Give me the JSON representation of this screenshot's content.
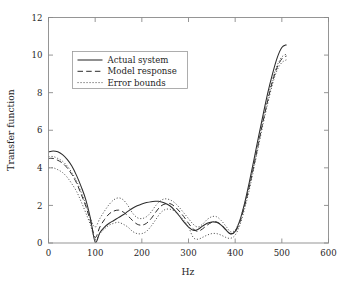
{
  "chart_data": {
    "type": "line",
    "title": "",
    "xlabel": "Hz",
    "ylabel": "Transfer function",
    "xlim": [
      0,
      600
    ],
    "ylim": [
      0,
      12
    ],
    "xticks": [
      0,
      100,
      200,
      300,
      400,
      500,
      600
    ],
    "yticks": [
      0,
      2,
      4,
      6,
      8,
      10,
      12
    ],
    "xtick_labels": [
      "0",
      "100",
      "200",
      "300",
      "400",
      "500",
      "600"
    ],
    "ytick_labels": [
      "0",
      "2",
      "4",
      "6",
      "8",
      "10",
      "12"
    ],
    "grid": false,
    "legend_position": "upper left inside",
    "line_color": "#2b2b2b",
    "axis_color": "#8a8a8a",
    "legend": [
      {
        "label": "Actual system",
        "style": "solid"
      },
      {
        "label": "Model response",
        "style": "dashed"
      },
      {
        "label": "Error bounds",
        "style": "dotted"
      }
    ],
    "series": [
      {
        "name": "Actual system",
        "style": "solid",
        "x": [
          0,
          10,
          20,
          30,
          40,
          50,
          60,
          70,
          80,
          90,
          100,
          110,
          120,
          130,
          140,
          150,
          160,
          170,
          180,
          190,
          200,
          210,
          220,
          230,
          235,
          240,
          250,
          260,
          270,
          280,
          290,
          300,
          310,
          320,
          330,
          340,
          350,
          360,
          370,
          380,
          390,
          400,
          410,
          420,
          430,
          440,
          450,
          460,
          470,
          480,
          490,
          500,
          510
        ],
        "y": [
          4.85,
          4.9,
          4.85,
          4.7,
          4.45,
          4.1,
          3.6,
          3.0,
          2.3,
          1.3,
          0.05,
          0.55,
          0.85,
          1.05,
          1.2,
          1.35,
          1.5,
          1.68,
          1.85,
          1.98,
          2.08,
          2.15,
          2.2,
          2.22,
          2.22,
          2.2,
          2.12,
          1.98,
          1.75,
          1.45,
          1.12,
          0.85,
          0.68,
          0.72,
          0.9,
          1.05,
          1.12,
          1.1,
          0.95,
          0.7,
          0.48,
          0.62,
          1.2,
          2.1,
          3.2,
          4.4,
          5.65,
          6.85,
          8.0,
          9.0,
          9.85,
          10.4,
          10.55
        ]
      },
      {
        "name": "Model response",
        "style": "dashed",
        "x": [
          0,
          10,
          20,
          30,
          40,
          50,
          60,
          70,
          80,
          90,
          100,
          110,
          120,
          130,
          140,
          150,
          160,
          170,
          180,
          190,
          200,
          210,
          220,
          230,
          240,
          250,
          260,
          270,
          280,
          290,
          300,
          310,
          320,
          330,
          340,
          350,
          360,
          370,
          380,
          390,
          400,
          410,
          420,
          430,
          440,
          450,
          460,
          470,
          480,
          490,
          500,
          510
        ],
        "y": [
          4.5,
          4.5,
          4.4,
          4.25,
          4.0,
          3.65,
          3.2,
          2.6,
          1.95,
          1.15,
          0.3,
          0.85,
          1.25,
          1.55,
          1.7,
          1.75,
          1.65,
          1.45,
          1.2,
          1.0,
          0.95,
          1.05,
          1.3,
          1.65,
          1.95,
          2.08,
          2.1,
          1.95,
          1.7,
          1.4,
          1.05,
          0.75,
          0.62,
          0.75,
          0.95,
          1.1,
          1.12,
          0.98,
          0.72,
          0.5,
          0.6,
          1.1,
          1.95,
          2.95,
          4.1,
          5.3,
          6.5,
          7.6,
          8.6,
          9.35,
          9.8,
          9.95
        ]
      },
      {
        "name": "Error bounds upper",
        "style": "dotted",
        "x": [
          0,
          10,
          20,
          30,
          40,
          50,
          60,
          70,
          80,
          90,
          100,
          110,
          120,
          130,
          140,
          150,
          160,
          170,
          180,
          190,
          200,
          210,
          220,
          230,
          240,
          250,
          260,
          270,
          280,
          290,
          300,
          310,
          320,
          330,
          340,
          350,
          360,
          370,
          380,
          390,
          400,
          410,
          420,
          430,
          440,
          450,
          460,
          470,
          480,
          490,
          500,
          510
        ],
        "y": [
          4.6,
          4.6,
          4.5,
          4.35,
          4.1,
          3.75,
          3.3,
          2.7,
          2.05,
          1.3,
          0.85,
          1.3,
          1.7,
          2.05,
          2.3,
          2.4,
          2.3,
          2.0,
          1.6,
          1.35,
          1.3,
          1.4,
          1.65,
          2.0,
          2.25,
          2.35,
          2.3,
          2.15,
          1.9,
          1.6,
          1.3,
          1.0,
          0.85,
          1.0,
          1.25,
          1.4,
          1.4,
          1.2,
          0.9,
          0.6,
          0.7,
          1.2,
          2.05,
          3.05,
          4.2,
          5.4,
          6.6,
          7.7,
          8.7,
          9.45,
          9.9,
          10.05
        ]
      },
      {
        "name": "Error bounds lower",
        "style": "dotted",
        "x": [
          0,
          10,
          20,
          30,
          40,
          50,
          60,
          70,
          80,
          90,
          100,
          110,
          120,
          130,
          140,
          150,
          160,
          170,
          180,
          190,
          200,
          210,
          220,
          230,
          240,
          250,
          260,
          270,
          280,
          290,
          300,
          310,
          320,
          330,
          340,
          350,
          360,
          370,
          380,
          390,
          400,
          410,
          420,
          430,
          440,
          450,
          460,
          470,
          480,
          490,
          500,
          510
        ],
        "y": [
          4.0,
          4.0,
          3.9,
          3.75,
          3.5,
          3.15,
          2.75,
          2.2,
          1.6,
          0.95,
          0.2,
          0.5,
          0.75,
          0.95,
          1.05,
          1.1,
          1.0,
          0.85,
          0.62,
          0.5,
          0.5,
          0.62,
          0.9,
          1.25,
          1.6,
          1.78,
          1.8,
          1.7,
          1.5,
          1.2,
          0.85,
          0.3,
          0.2,
          0.3,
          0.42,
          0.5,
          0.5,
          0.42,
          0.3,
          0.25,
          0.42,
          0.95,
          1.8,
          2.8,
          3.95,
          5.15,
          6.35,
          7.45,
          8.45,
          9.2,
          9.6,
          9.75
        ]
      }
    ]
  }
}
